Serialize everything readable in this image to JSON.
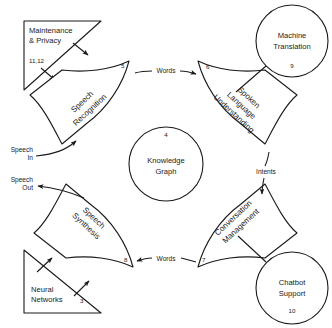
{
  "diagram": {
    "stroke_color": "#1a1a1a",
    "background_color": "#ffffff",
    "center": {
      "id": "knowledge-graph",
      "label_line1": "Knowledge",
      "label_line2": "Graph",
      "number": "4",
      "shape": "circle"
    },
    "wedges": [
      {
        "id": "speech-recognition",
        "label_line1": "Speech",
        "label_line2": "Recognition",
        "number": "5",
        "position": "top-left",
        "shape": "curved-sector"
      },
      {
        "id": "spoken-language-understanding",
        "label_line1": "Spoken",
        "label_line2": "Language",
        "label_line3": "Understanding",
        "number": "6",
        "position": "top-right",
        "shape": "curved-sector"
      },
      {
        "id": "conversation-management",
        "label_line1": "Conversation",
        "label_line2": "Management",
        "number": "7",
        "position": "bottom-right",
        "shape": "curved-sector"
      },
      {
        "id": "speech-synthesis",
        "label_line1": "Speech",
        "label_line2": "Synthesis",
        "number": "8",
        "position": "bottom-left",
        "shape": "curved-sector"
      }
    ],
    "circles": [
      {
        "id": "machine-translation",
        "label_line1": "Machine",
        "label_line2": "Translation",
        "number": "9",
        "position": "top-right",
        "shape": "circle"
      },
      {
        "id": "chatbot-support",
        "label_line1": "Chatbot",
        "label_line2": "Support",
        "number": "10",
        "position": "bottom-right",
        "shape": "circle"
      }
    ],
    "triangles": [
      {
        "id": "maintenance-privacy",
        "label_line1": "Maintenance",
        "label_line2": "& Privacy",
        "number": "11,12",
        "position": "top-left",
        "shape": "right-triangle"
      },
      {
        "id": "neural-networks",
        "label_line1": "Neural",
        "label_line2": "Networks",
        "number": "3",
        "position": "bottom-left",
        "shape": "right-triangle"
      }
    ],
    "flows": [
      {
        "id": "speech-in",
        "label_line1": "Speech",
        "label_line2": "In",
        "direction": "into-speech-recognition"
      },
      {
        "id": "words-top",
        "label": "Words",
        "direction": "speech-recognition-to-slu"
      },
      {
        "id": "intents",
        "label": "Intents",
        "direction": "slu-to-conversation-management"
      },
      {
        "id": "words-bottom",
        "label": "Words",
        "direction": "conversation-management-to-speech-synthesis"
      },
      {
        "id": "speech-out",
        "label_line1": "Speech",
        "label_line2": "Out",
        "direction": "out-of-speech-synthesis"
      }
    ]
  }
}
